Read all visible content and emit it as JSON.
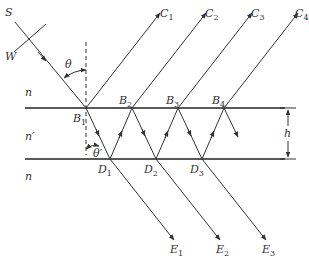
{
  "diagram": {
    "media": {
      "outer_top": "n",
      "slab": "n′",
      "outer_bottom": "n"
    },
    "source_label": "S",
    "wavefront_label": "W",
    "angles": {
      "incident": "θ",
      "refracted": "θ′"
    },
    "thickness_label": "h",
    "top_points": [
      {
        "name": "B",
        "sub": "1"
      },
      {
        "name": "B",
        "sub": "2"
      },
      {
        "name": "B",
        "sub": "3"
      },
      {
        "name": "B",
        "sub": "4"
      }
    ],
    "bottom_points": [
      {
        "name": "D",
        "sub": "1"
      },
      {
        "name": "D",
        "sub": "2"
      },
      {
        "name": "D",
        "sub": "3"
      }
    ],
    "reflected_beams": [
      {
        "name": "C",
        "sub": "1"
      },
      {
        "name": "C",
        "sub": "2"
      },
      {
        "name": "C",
        "sub": "3"
      },
      {
        "name": "C",
        "sub": "4"
      }
    ],
    "transmitted_beams": [
      {
        "name": "E",
        "sub": "1"
      },
      {
        "name": "E",
        "sub": "2"
      },
      {
        "name": "E",
        "sub": "3"
      }
    ]
  }
}
